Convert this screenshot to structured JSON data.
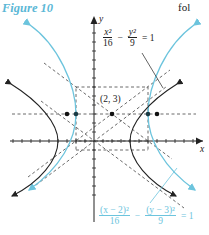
{
  "figure": {
    "title": "Figure 10",
    "cut_text": "fol"
  },
  "axes": {
    "x_label": "x",
    "y_label": "y"
  },
  "center_label": "(2, 3)",
  "equations": {
    "centered": {
      "num1": "x²",
      "den1": "16",
      "op": "−",
      "num2": "y²",
      "den2": "9",
      "rhs": "= 1"
    },
    "shifted": {
      "num1": "(x − 2)²",
      "den1": "16",
      "op": "−",
      "num2": "(y − 3)²",
      "den2": "9",
      "rhs": "= 1"
    }
  },
  "colors": {
    "black_curve": "#222222",
    "cyan_curve": "#6cc4dd",
    "title": "#5bb8d6"
  },
  "geometry": {
    "unit_px": 9,
    "origin_px": [
      94,
      141
    ],
    "centered_hyperbola": {
      "a": 4,
      "b": 3,
      "center": [
        0,
        0
      ]
    },
    "shifted_hyperbola": {
      "a": 4,
      "b": 3,
      "center": [
        2,
        3
      ]
    },
    "points": [
      [
        -3,
        3
      ],
      [
        -2,
        3
      ],
      [
        2,
        3
      ],
      [
        6,
        3
      ],
      [
        7,
        3
      ]
    ]
  }
}
